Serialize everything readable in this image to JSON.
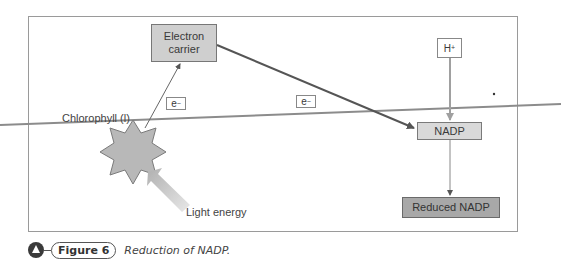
{
  "diagram": {
    "title": "Reduction of NADP",
    "nodes": {
      "electron_carrier": "Electron carrier",
      "electron_carrier_line1": "Electron",
      "electron_carrier_line2": "carrier",
      "e_label_1_base": "e",
      "e_label_1_sup": "−",
      "e_label_2_base": "e",
      "e_label_2_sup": "−",
      "hplus_base": "H",
      "hplus_sup": "+",
      "nadp": "NADP",
      "reduced_nadp": "Reduced NADP",
      "chlorophyll": "Chlorophyll (l)",
      "light_energy": "Light energy"
    },
    "edges": [
      {
        "from": "chlorophyll",
        "to": "electron_carrier",
        "label": "e−"
      },
      {
        "from": "electron_carrier",
        "to": "nadp",
        "label": "e−"
      },
      {
        "from": "hplus",
        "to": "nadp"
      },
      {
        "from": "nadp",
        "to": "reduced_nadp"
      },
      {
        "from": "light_energy",
        "to": "chlorophyll"
      }
    ],
    "colors": {
      "carrier_fill": "#cfcfcf",
      "nadp_fill": "#d9d9d9",
      "reduced_fill": "#a8a8a8",
      "star_fill": "#b8b8b8",
      "arrow_dark": "#555555",
      "arrow_light": "#a0a0a0"
    }
  },
  "caption": {
    "figure_label": "Figure 6",
    "text": "Reduction of NADP."
  }
}
